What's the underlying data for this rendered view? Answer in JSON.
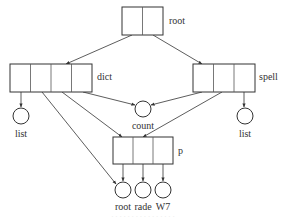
{
  "diagram": {
    "type": "pointer-structure",
    "records": [
      {
        "id": "root",
        "label": "root",
        "cells": 2,
        "x": 122,
        "y": 7,
        "w": 41,
        "h": 28
      },
      {
        "id": "dict",
        "label": "dict",
        "cells": 4,
        "x": 10,
        "y": 64,
        "w": 82,
        "h": 28
      },
      {
        "id": "spell",
        "label": "spell",
        "cells": 3,
        "x": 193,
        "y": 64,
        "w": 62,
        "h": 28
      },
      {
        "id": "p",
        "label": "p",
        "cells": 3,
        "x": 113,
        "y": 137,
        "w": 60,
        "h": 27
      }
    ],
    "nodes": [
      {
        "id": "list_left",
        "label": "list",
        "cx": 20,
        "cy": 116,
        "r": 8
      },
      {
        "id": "count",
        "label": "count",
        "cx": 143,
        "cy": 109,
        "r": 8
      },
      {
        "id": "list_right",
        "label": "list",
        "cx": 245,
        "cy": 116,
        "r": 8
      },
      {
        "id": "root_leaf",
        "label": "root",
        "cx": 122,
        "cy": 190,
        "r": 8
      },
      {
        "id": "rade",
        "label": "rade",
        "cx": 143,
        "cy": 190,
        "r": 8
      },
      {
        "id": "w7",
        "label": "W7",
        "cx": 163,
        "cy": 190,
        "r": 8
      }
    ],
    "edges": [
      {
        "from": "root",
        "to": "dict"
      },
      {
        "from": "root",
        "to": "spell"
      },
      {
        "from": "dict",
        "to": "list_left"
      },
      {
        "from": "dict",
        "to": "count"
      },
      {
        "from": "dict",
        "to": "p"
      },
      {
        "from": "dict",
        "to": "root_leaf"
      },
      {
        "from": "spell",
        "to": "count"
      },
      {
        "from": "spell",
        "to": "p"
      },
      {
        "from": "spell",
        "to": "list_right"
      },
      {
        "from": "p",
        "to": "root_leaf"
      },
      {
        "from": "p",
        "to": "rade"
      },
      {
        "from": "p",
        "to": "w7"
      }
    ],
    "labels": {
      "root": "root",
      "dict": "dict",
      "spell": "spell",
      "p": "p",
      "count": "count",
      "list_left": "list",
      "list_right": "list",
      "root_leaf": "root",
      "rade": "rade",
      "w7": "W7"
    },
    "caption": "· · · · · · · · · · · · · · · ·"
  }
}
